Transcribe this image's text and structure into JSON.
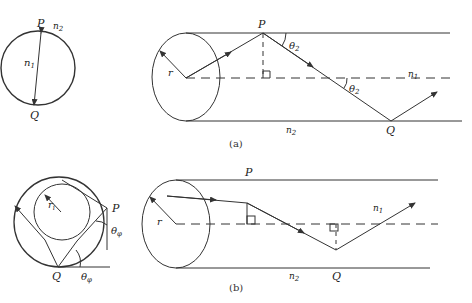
{
  "figure": {
    "panel_a": {
      "caption": "(a)",
      "cross_section": {
        "point_top": "P",
        "point_bottom": "Q",
        "core_index": "n",
        "core_index_sub": "1",
        "cladding_index": "n",
        "cladding_index_sub": "2"
      },
      "fiber": {
        "radius_label": "r",
        "point_top": "P",
        "point_bottom": "Q",
        "angle_label": "θ",
        "angle_sub": "2",
        "core_index": "n",
        "core_index_sub": "1",
        "cladding_index": "n",
        "cladding_index_sub": "2"
      },
      "description": "Meridional ray: passes through fiber axis, reflecting at P and Q with angle θ2"
    },
    "panel_b": {
      "caption": "(b)",
      "cross_section": {
        "inner_radius_label": "r",
        "inner_radius_sub": "i",
        "point_right": "P",
        "point_bottom": "Q",
        "angle_label": "θ",
        "angle_sub": "φ"
      },
      "fiber": {
        "radius_label": "r",
        "point_top": "P",
        "point_bottom": "Q",
        "core_index": "n",
        "core_index_sub": "1",
        "cladding_index": "n",
        "cladding_index_sub": "2"
      },
      "description": "Skew ray: never crosses the axis, tangent to inner caustic circle of radius ri"
    },
    "colors": {
      "line": "#333333",
      "background": "#ffffff"
    }
  }
}
